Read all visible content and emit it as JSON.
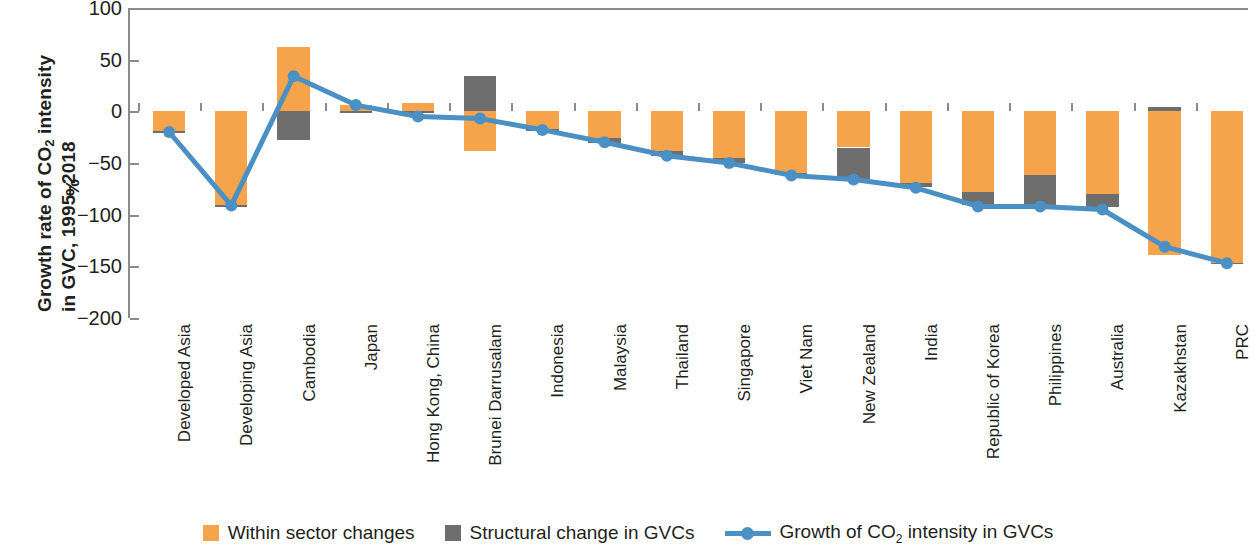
{
  "chart_data": {
    "type": "bar",
    "title": "",
    "ylabel": "Growth rate of CO2 intensity in GVC, 1995-2018",
    "ylabel_line1": "Growth rate of CO",
    "ylabel_line1_sub": "2",
    "ylabel_line1_tail": " intensity",
    "ylabel_line2": "in GVC, 1995–2018",
    "yunit": "%",
    "xlabel": "",
    "ylim": [
      -200,
      100
    ],
    "yticks": [
      100,
      50,
      0,
      -50,
      -100,
      -150,
      -200
    ],
    "ytick_labels": [
      "100",
      "50",
      "0",
      "−50",
      "−100",
      "−150",
      "−200"
    ],
    "grid": false,
    "stacked": true,
    "legend_position": "bottom",
    "categories": [
      "Developed Asia",
      "Developing Asia",
      "Cambodia",
      "Japan",
      "Hong Kong, China",
      "Brunei Darrusalam",
      "Indonesia",
      "Malaysia",
      "Thailand",
      "Singapore",
      "Viet Nam",
      "New Zealand",
      "India",
      "Republic of Korea",
      "Philippines",
      "Australia",
      "Kazakhstan",
      "PRC"
    ],
    "series": [
      {
        "name": "Within sector changes",
        "type": "bar",
        "color": "#F5A44B",
        "values": [
          -19,
          -91,
          62,
          6,
          8,
          -38,
          -17,
          -26,
          -38,
          -45,
          -60,
          -35,
          -69,
          -78,
          -62,
          -80,
          -139,
          -147
        ]
      },
      {
        "name": "Structural change in GVCs",
        "type": "bar",
        "color": "#6E6E6E",
        "values": [
          -2,
          -2,
          -28,
          -2,
          -2,
          34,
          -2,
          -5,
          -5,
          -5,
          -2,
          -31,
          -4,
          -13,
          -30,
          -13,
          4,
          -1
        ]
      },
      {
        "name": "Growth of CO2 intensity in GVCs",
        "type": "line",
        "color": "#4A90C4",
        "values": [
          -20,
          -91,
          34,
          6,
          -5,
          -7,
          -18,
          -30,
          -43,
          -50,
          -62,
          -66,
          -74,
          -92,
          -92,
          -95,
          -131,
          -147
        ]
      }
    ],
    "legend": [
      {
        "label": "Within sector changes",
        "marker": "square",
        "color": "#F5A44B"
      },
      {
        "label": "Structural change in GVCs",
        "marker": "square",
        "color": "#6E6E6E"
      },
      {
        "label": "Growth of CO",
        "label_sub": "2",
        "label_tail": " intensity in GVCs",
        "marker": "line",
        "color": "#4A90C4"
      }
    ]
  }
}
